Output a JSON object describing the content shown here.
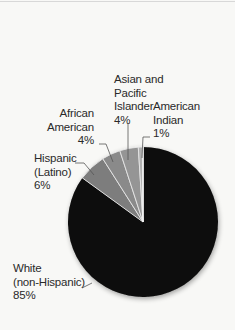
{
  "chart_data": {
    "type": "pie",
    "title": "",
    "start_angle_deg": 0,
    "slices": [
      {
        "label": "White (non-Hispanic)",
        "value": 85,
        "color": "#0a0a0a"
      },
      {
        "label": "Hispanic (Latino)",
        "value": 6,
        "color": "#7d7d7d"
      },
      {
        "label": "African American",
        "value": 4,
        "color": "#8a8a8a"
      },
      {
        "label": "Asian and Pacific Islander",
        "value": 4,
        "color": "#959595"
      },
      {
        "label": "American Indian",
        "value": 1,
        "color": "#b0b0b0"
      }
    ],
    "units": "%",
    "legend": "none (leader-line labels)"
  },
  "labels": {
    "asian": {
      "line1": "Asian and",
      "line2": "Pacific",
      "line3": "Islander",
      "pct": "4%"
    },
    "american_indian": {
      "line1": "American",
      "line2": "Indian",
      "pct": "1%"
    },
    "african_american": {
      "line1": "African",
      "line2": "American",
      "pct": "4%"
    },
    "hispanic": {
      "line1": "Hispanic",
      "line2": "(Latino)",
      "pct": "6%"
    },
    "white": {
      "line1": "White",
      "line2": "(non-Hispanic)",
      "pct": "85%"
    }
  }
}
